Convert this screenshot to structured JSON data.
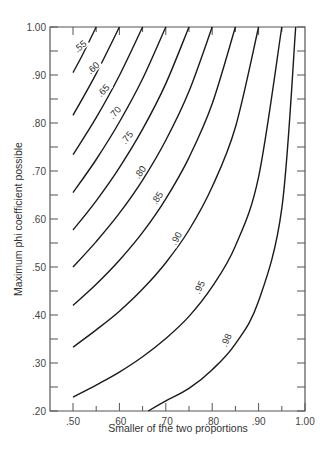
{
  "chart_data": {
    "type": "line",
    "title": "",
    "xlabel": "Smaller of the two proportions",
    "ylabel": "Maximum phi coefficient possible",
    "xlim": [
      0.5,
      1.0
    ],
    "ylim": [
      0.2,
      1.0
    ],
    "grid": false,
    "legend": "none (curves labeled inline)",
    "x_ticks": [
      ".50",
      ".60",
      ".70",
      ".80",
      ".90",
      "1.00"
    ],
    "x_tick_values": [
      0.5,
      0.6,
      0.7,
      0.8,
      0.9,
      1.0
    ],
    "y_ticks": [
      ".20",
      ".30",
      ".40",
      ".50",
      ".60",
      ".70",
      ".80",
      ".90",
      "1.00"
    ],
    "y_tick_values": [
      0.2,
      0.3,
      0.4,
      0.5,
      0.6,
      0.7,
      0.8,
      0.9,
      1.0
    ],
    "series": [
      {
        "name": ".55",
        "label_pos": [
          0.515,
          0.96
        ],
        "points": [
          [
            0.5,
            0.905
          ],
          [
            0.52,
            0.941
          ],
          [
            0.55,
            1.0
          ]
        ]
      },
      {
        "name": ".60",
        "label_pos": [
          0.543,
          0.915
        ],
        "points": [
          [
            0.5,
            0.816
          ],
          [
            0.55,
            0.903
          ],
          [
            0.6,
            1.0
          ]
        ]
      },
      {
        "name": ".65",
        "label_pos": [
          0.565,
          0.868
        ],
        "points": [
          [
            0.5,
            0.734
          ],
          [
            0.55,
            0.811
          ],
          [
            0.6,
            0.899
          ],
          [
            0.65,
            1.0
          ]
        ]
      },
      {
        "name": ".70",
        "label_pos": [
          0.59,
          0.822
        ],
        "points": [
          [
            0.5,
            0.655
          ],
          [
            0.55,
            0.724
          ],
          [
            0.6,
            0.802
          ],
          [
            0.65,
            0.892
          ],
          [
            0.7,
            1.0
          ]
        ]
      },
      {
        "name": ".75",
        "label_pos": [
          0.616,
          0.77
        ],
        "points": [
          [
            0.5,
            0.577
          ],
          [
            0.55,
            0.638
          ],
          [
            0.6,
            0.707
          ],
          [
            0.65,
            0.787
          ],
          [
            0.7,
            0.882
          ],
          [
            0.75,
            1.0
          ]
        ]
      },
      {
        "name": ".80",
        "label_pos": [
          0.644,
          0.698
        ],
        "points": [
          [
            0.5,
            0.5
          ],
          [
            0.55,
            0.553
          ],
          [
            0.6,
            0.612
          ],
          [
            0.65,
            0.681
          ],
          [
            0.7,
            0.764
          ],
          [
            0.75,
            0.866
          ],
          [
            0.8,
            1.0
          ]
        ]
      },
      {
        "name": ".85",
        "label_pos": [
          0.681,
          0.644
        ],
        "points": [
          [
            0.5,
            0.42
          ],
          [
            0.55,
            0.464
          ],
          [
            0.6,
            0.514
          ],
          [
            0.65,
            0.572
          ],
          [
            0.7,
            0.642
          ],
          [
            0.75,
            0.728
          ],
          [
            0.8,
            0.84
          ],
          [
            0.85,
            1.0
          ]
        ]
      },
      {
        "name": ".90",
        "label_pos": [
          0.722,
          0.56
        ],
        "points": [
          [
            0.5,
            0.333
          ],
          [
            0.55,
            0.369
          ],
          [
            0.6,
            0.408
          ],
          [
            0.65,
            0.454
          ],
          [
            0.7,
            0.509
          ],
          [
            0.75,
            0.577
          ],
          [
            0.8,
            0.667
          ],
          [
            0.85,
            0.791
          ],
          [
            0.9,
            1.0
          ]
        ]
      },
      {
        "name": ".95",
        "label_pos": [
          0.772,
          0.458
        ],
        "points": [
          [
            0.5,
            0.229
          ],
          [
            0.55,
            0.254
          ],
          [
            0.6,
            0.281
          ],
          [
            0.65,
            0.313
          ],
          [
            0.7,
            0.351
          ],
          [
            0.75,
            0.397
          ],
          [
            0.8,
            0.459
          ],
          [
            0.85,
            0.544
          ],
          [
            0.9,
            0.688
          ],
          [
            0.95,
            1.0
          ]
        ]
      },
      {
        "name": ".98",
        "label_pos": [
          0.83,
          0.348
        ],
        "points": [
          [
            0.662,
            0.2
          ],
          [
            0.7,
            0.221
          ],
          [
            0.75,
            0.247
          ],
          [
            0.8,
            0.286
          ],
          [
            0.85,
            0.34
          ],
          [
            0.9,
            0.429
          ],
          [
            0.95,
            0.622
          ],
          [
            0.98,
            1.0
          ]
        ]
      }
    ]
  },
  "colors": {
    "curve": "#1a1a1a",
    "axis": "#555555",
    "text": "#333333",
    "background": "#ffffff"
  }
}
